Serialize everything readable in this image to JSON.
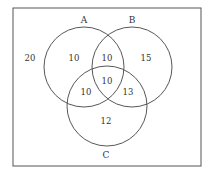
{
  "diagram": {
    "type": "venn",
    "sets": [
      {
        "name": "A",
        "label": "A",
        "cx": 84,
        "cy": 67,
        "r": 40,
        "label_x": 84,
        "label_y": 23
      },
      {
        "name": "B",
        "label": "B",
        "cx": 132,
        "cy": 67,
        "r": 40,
        "label_x": 132,
        "label_y": 23
      },
      {
        "name": "C",
        "label": "C",
        "cx": 107,
        "cy": 106,
        "r": 40,
        "label_x": 106,
        "label_y": 158
      }
    ],
    "regions": [
      {
        "id": "outside",
        "value": "20",
        "x": 30,
        "y": 61
      },
      {
        "id": "A_only",
        "value": "10",
        "x": 74,
        "y": 61
      },
      {
        "id": "A_and_B_only",
        "value": "10",
        "x": 107,
        "y": 61
      },
      {
        "id": "B_only",
        "value": "15",
        "x": 146,
        "y": 61
      },
      {
        "id": "A_and_B_and_C",
        "value": "10",
        "x": 107,
        "y": 84
      },
      {
        "id": "A_and_C_only",
        "value": "10",
        "x": 86,
        "y": 95
      },
      {
        "id": "B_and_C_only",
        "value": "13",
        "x": 128,
        "y": 95
      },
      {
        "id": "C_only",
        "value": "12",
        "x": 106,
        "y": 124
      }
    ],
    "frame": {
      "x": 13,
      "y": 8,
      "width": 188,
      "height": 158
    },
    "stroke_color": "#444444"
  }
}
